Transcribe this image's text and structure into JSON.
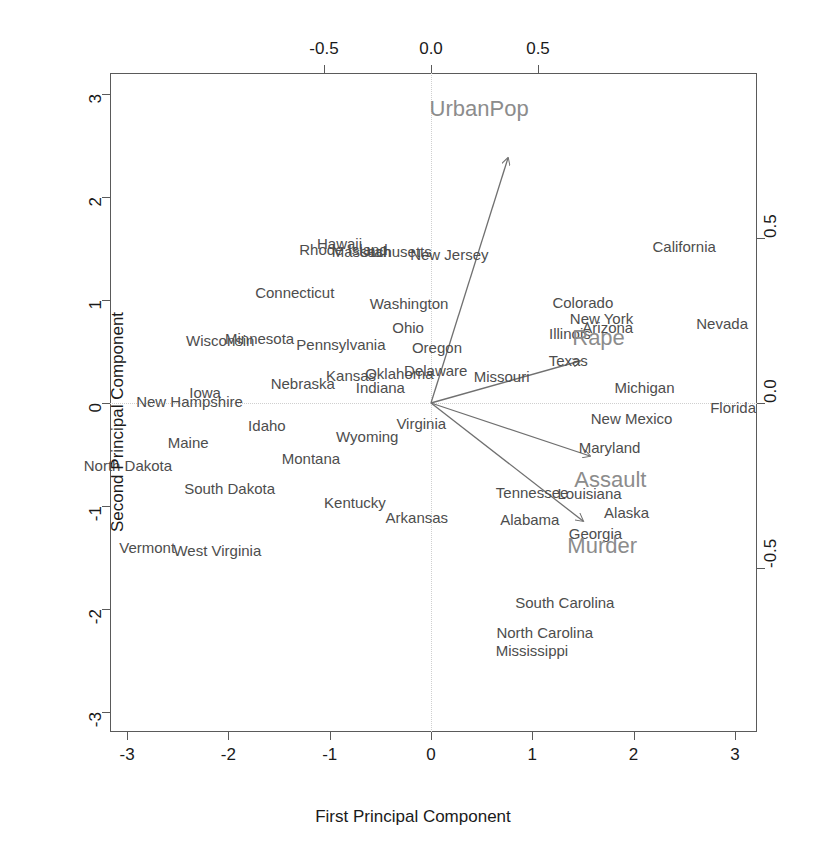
{
  "chart_data": {
    "type": "scatter",
    "title": "",
    "subtitle": "",
    "xlabel": "First Principal Component",
    "ylabel": "Second Principal Component",
    "xlim": [
      -3.5,
      3.5
    ],
    "ylim": [
      -3.3,
      3.3
    ],
    "grid": false,
    "legend": "none",
    "bottom_axis": {
      "label": "First Principal Component",
      "ticks": [
        "-3",
        "-2",
        "-1",
        "0",
        "1",
        "2",
        "3"
      ],
      "values": [
        -3,
        -2,
        -1,
        0,
        1,
        2,
        3
      ]
    },
    "left_axis": {
      "label": "Second Principal Component",
      "ticks": [
        "-3",
        "-2",
        "-1",
        "0",
        "1",
        "2",
        "3"
      ],
      "values": [
        -3,
        -2,
        -1,
        0,
        1,
        2,
        3
      ]
    },
    "top_axis": {
      "label": "",
      "ticks": [
        "-0.5",
        "0.0",
        "0.5"
      ],
      "values": [
        -0.5,
        0.0,
        0.5
      ]
    },
    "right_axis": {
      "label": "",
      "ticks": [
        "0.5",
        "0.0",
        "-0.5"
      ],
      "values": [
        0.5,
        0.0,
        -0.5
      ]
    },
    "colors": {
      "observation_label": "#4d4d4d",
      "variable_label": "#8c8c8c",
      "arrow": "#707070",
      "axis": "#5a5a5a",
      "zeroline": "#cfcfcf",
      "tick_text": "#1a1a1a"
    },
    "observations": [
      {
        "label": "Alabama",
        "x": 0.976,
        "y": -1.122
      },
      {
        "label": "Alaska",
        "x": 1.931,
        "y": -1.062
      },
      {
        "label": "Arizona",
        "x": 1.745,
        "y": 0.738
      },
      {
        "label": "Arkansas",
        "x": -0.14,
        "y": -1.109
      },
      {
        "label": "California",
        "x": 2.499,
        "y": 1.527
      },
      {
        "label": "Colorado",
        "x": 1.499,
        "y": 0.978
      },
      {
        "label": "Connecticut",
        "x": -1.345,
        "y": 1.077
      },
      {
        "label": "Delaware",
        "x": 0.047,
        "y": 0.325
      },
      {
        "label": "Florida",
        "x": 2.982,
        "y": -0.039
      },
      {
        "label": "Georgia",
        "x": 1.623,
        "y": -1.266
      },
      {
        "label": "Hawaii",
        "x": -0.903,
        "y": 1.554
      },
      {
        "label": "Idaho",
        "x": -1.62,
        "y": -0.21
      },
      {
        "label": "Illinois",
        "x": 1.371,
        "y": 0.675
      },
      {
        "label": "Indiana",
        "x": -0.5,
        "y": 0.151
      },
      {
        "label": "Iowa",
        "x": -2.23,
        "y": 0.102
      },
      {
        "label": "Kansas",
        "x": -0.789,
        "y": 0.27
      },
      {
        "label": "Kentucky",
        "x": -0.751,
        "y": -0.958
      },
      {
        "label": "Louisiana",
        "x": 1.565,
        "y": -0.871
      },
      {
        "label": "Maine",
        "x": -2.397,
        "y": -0.376
      },
      {
        "label": "Maryland",
        "x": 1.763,
        "y": -0.428
      },
      {
        "label": "Massachusetts",
        "x": -0.486,
        "y": 1.474
      },
      {
        "label": "Michigan",
        "x": 2.108,
        "y": 0.155
      },
      {
        "label": "Minnesota",
        "x": -1.692,
        "y": 0.632
      },
      {
        "label": "Mississippi",
        "x": 0.996,
        "y": -2.394
      },
      {
        "label": "Missouri",
        "x": 0.697,
        "y": 0.263
      },
      {
        "label": "Montana",
        "x": -1.185,
        "y": -0.536
      },
      {
        "label": "Nebraska",
        "x": -1.266,
        "y": 0.194
      },
      {
        "label": "Nevada",
        "x": 2.874,
        "y": 0.776
      },
      {
        "label": "New Hampshire",
        "x": -2.384,
        "y": 0.018
      },
      {
        "label": "New Jersey",
        "x": 0.181,
        "y": 1.449
      },
      {
        "label": "New Mexico",
        "x": 1.98,
        "y": -0.142
      },
      {
        "label": "New York",
        "x": 1.683,
        "y": 0.823
      },
      {
        "label": "North Carolina",
        "x": 1.123,
        "y": -2.228
      },
      {
        "label": "North Dakota",
        "x": -2.992,
        "y": -0.599
      },
      {
        "label": "Ohio",
        "x": -0.226,
        "y": 0.742
      },
      {
        "label": "Oklahoma",
        "x": -0.312,
        "y": 0.287
      },
      {
        "label": "Oregon",
        "x": 0.059,
        "y": 0.541
      },
      {
        "label": "Pennsylvania",
        "x": -0.889,
        "y": 0.571
      },
      {
        "label": "Rhode Island",
        "x": -0.864,
        "y": 1.492
      },
      {
        "label": "South Carolina",
        "x": 1.321,
        "y": -1.934
      },
      {
        "label": "South Dakota",
        "x": -1.988,
        "y": -0.824
      },
      {
        "label": "Tennessee",
        "x": 0.998,
        "y": -0.862
      },
      {
        "label": "Texas",
        "x": 1.355,
        "y": 0.413
      },
      {
        "label": "Utah",
        "x": -0.551,
        "y": 1.471
      },
      {
        "label": "Vermont",
        "x": -2.802,
        "y": -1.398
      },
      {
        "label": "Virginia",
        "x": -0.096,
        "y": -0.199
      },
      {
        "label": "Washington",
        "x": -0.217,
        "y": 0.97
      },
      {
        "label": "West Virginia",
        "x": -2.109,
        "y": -1.424
      },
      {
        "label": "Wisconsin",
        "x": -2.08,
        "y": 0.611
      },
      {
        "label": "Wyoming",
        "x": -0.629,
        "y": -0.321
      }
    ],
    "variables": [
      {
        "label": "UrbanPop",
        "x": 0.225,
        "y": 0.746,
        "label_x": 0.225,
        "label_y": 0.89
      },
      {
        "label": "Rape",
        "x": 0.723,
        "y": 0.128,
        "label_x": 0.783,
        "label_y": 0.198
      },
      {
        "label": "Assault",
        "x": 0.769,
        "y": -0.161,
        "label_x": 0.838,
        "label_y": -0.232
      },
      {
        "label": "Murder",
        "x": 0.735,
        "y": -0.358,
        "label_x": 0.8,
        "label_y": -0.432
      }
    ]
  }
}
